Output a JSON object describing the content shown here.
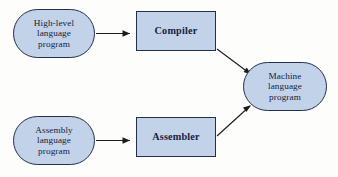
{
  "diagram": {
    "background_color": "#fdfdfc",
    "node_fill_color": "#c2d3e9",
    "node_border_color": "#23304d",
    "text_color": "#16213d",
    "edge_color": "#1b1b1b",
    "nodes": [
      {
        "id": "highlevel",
        "shape": "stadium",
        "lines": [
          "High-level",
          "language",
          "program"
        ]
      },
      {
        "id": "compiler",
        "shape": "rect",
        "lines": [
          "Compiler"
        ]
      },
      {
        "id": "machine",
        "shape": "stadium",
        "lines": [
          "Machine",
          "language",
          "program"
        ]
      },
      {
        "id": "assembly",
        "shape": "stadium",
        "lines": [
          "Assembly",
          "language",
          "program"
        ]
      },
      {
        "id": "assembler",
        "shape": "rect",
        "lines": [
          "Assembler"
        ]
      }
    ],
    "edges": [
      {
        "id": "highlevel-to-compiler",
        "from": "highlevel",
        "to": "compiler",
        "style": "straight-arrow"
      },
      {
        "id": "compiler-to-machine",
        "from": "compiler",
        "to": "machine",
        "style": "diagonal-arrow"
      },
      {
        "id": "assembly-to-assembler",
        "from": "assembly",
        "to": "assembler",
        "style": "straight-arrow"
      },
      {
        "id": "assembler-to-machine",
        "from": "assembler",
        "to": "machine",
        "style": "diagonal-arrow"
      }
    ]
  }
}
